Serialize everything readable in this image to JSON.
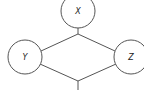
{
  "diagram": {
    "type": "graph",
    "colors": {
      "stroke": "#555555",
      "fill": "#ffffff",
      "text": "#222222"
    },
    "nodes": [
      {
        "id": "X",
        "label": "X"
      },
      {
        "id": "Y",
        "label": "Y"
      },
      {
        "id": "Z",
        "label": "Z"
      }
    ],
    "edges": [
      {
        "from": "X",
        "to": "Y"
      },
      {
        "from": "X",
        "to": "Z"
      },
      {
        "from": "Y",
        "to": "bottom"
      },
      {
        "from": "Z",
        "to": "bottom"
      }
    ]
  }
}
